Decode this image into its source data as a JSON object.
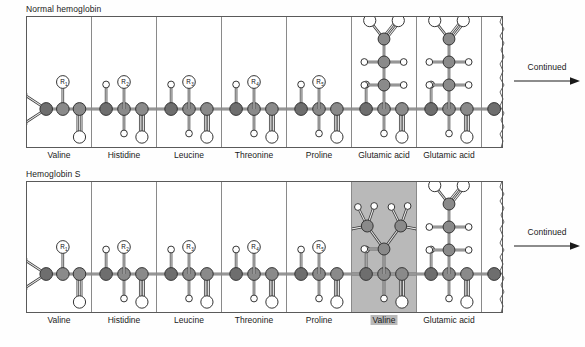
{
  "figure": {
    "panels": [
      {
        "id": "normal",
        "title": "Normal hemoglobin",
        "continued_label": "Continued",
        "residues": [
          {
            "label": "Valine",
            "r_label": "R",
            "r_sub": "1",
            "type": "n-terminal",
            "highlighted": false
          },
          {
            "label": "Histidine",
            "r_label": "R",
            "r_sub": "2",
            "type": "r-generic",
            "highlighted": false
          },
          {
            "label": "Leucine",
            "r_label": "R",
            "r_sub": "3",
            "type": "r-generic",
            "highlighted": false
          },
          {
            "label": "Threonine",
            "r_label": "R",
            "r_sub": "4",
            "type": "r-generic",
            "highlighted": false
          },
          {
            "label": "Proline",
            "r_label": "R",
            "r_sub": "5",
            "type": "r-generic",
            "highlighted": false
          },
          {
            "label": "Glutamic acid",
            "r_label": "",
            "r_sub": "",
            "type": "glutamate",
            "highlighted": false
          },
          {
            "label": "Glutamic acid",
            "r_label": "",
            "r_sub": "",
            "type": "glutamate",
            "highlighted": false
          },
          {
            "label": "",
            "r_label": "",
            "r_sub": "",
            "type": "tail",
            "highlighted": false
          }
        ]
      },
      {
        "id": "sickle",
        "title": "Hemoglobin S",
        "continued_label": "Continued",
        "residues": [
          {
            "label": "Valine",
            "r_label": "R",
            "r_sub": "1",
            "type": "n-terminal",
            "highlighted": false
          },
          {
            "label": "Histidine",
            "r_label": "R",
            "r_sub": "2",
            "type": "r-generic",
            "highlighted": false
          },
          {
            "label": "Leucine",
            "r_label": "R",
            "r_sub": "3",
            "type": "r-generic",
            "highlighted": false
          },
          {
            "label": "Threonine",
            "r_label": "R",
            "r_sub": "4",
            "type": "r-generic",
            "highlighted": false
          },
          {
            "label": "Proline",
            "r_label": "R",
            "r_sub": "5",
            "type": "r-generic",
            "highlighted": false
          },
          {
            "label": "Valine",
            "r_label": "",
            "r_sub": "",
            "type": "valine",
            "highlighted": true
          },
          {
            "label": "Glutamic acid",
            "r_label": "",
            "r_sub": "",
            "type": "glutamate",
            "highlighted": false
          },
          {
            "label": "",
            "r_label": "",
            "r_sub": "",
            "type": "tail",
            "highlighted": false
          }
        ]
      }
    ],
    "colors": {
      "backbone_atom": "#8a8a8a",
      "nitrogen_atom": "#6e6e6e",
      "hydrogen_atom": "#ffffff",
      "oxygen_atom": "#ffffff",
      "mutation_highlight": "#b9b9b9",
      "outline": "#333333",
      "panel_border": "#5a5a5a"
    },
    "legend_note": {
      "substituted_residue": "Valine",
      "replaced_residue": "Glutamic acid",
      "position_in_chain": "6"
    }
  }
}
